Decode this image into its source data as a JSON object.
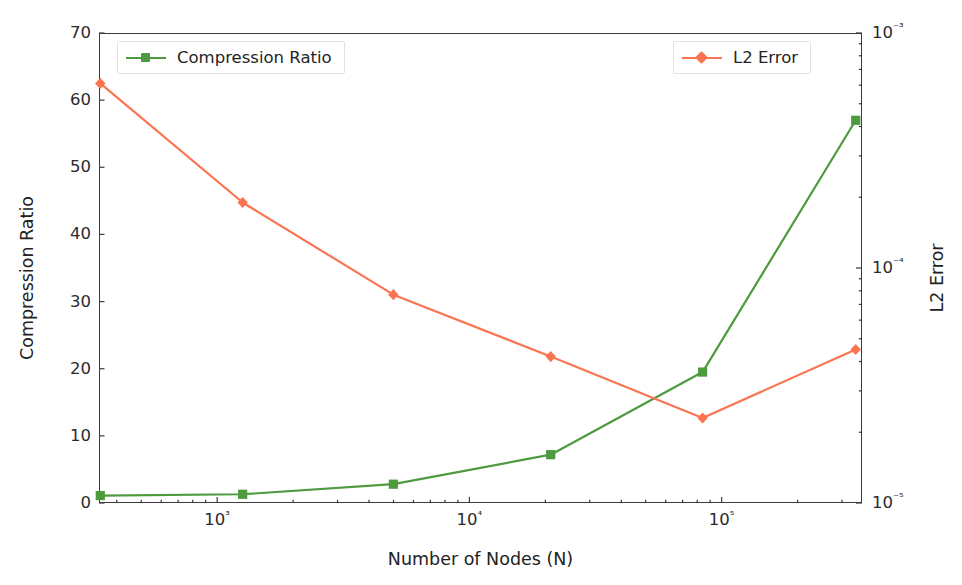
{
  "chart_data": {
    "type": "line",
    "title": "",
    "xlabel": "Number of Nodes (N)",
    "xscale": "log",
    "xlim": [
      340,
      360000
    ],
    "xticks": [
      1000,
      10000,
      100000
    ],
    "xticklabels": [
      "10³",
      "10⁴",
      "10⁵"
    ],
    "grid": false,
    "legend_position": "top-left and top-right",
    "axes": [
      {
        "side": "left",
        "ylabel": "Compression Ratio",
        "yscale": "linear",
        "ylim": [
          0,
          70
        ],
        "yticks": [
          0,
          10,
          20,
          30,
          40,
          50,
          60,
          70
        ],
        "yticklabels": [
          "0",
          "10",
          "20",
          "30",
          "40",
          "50",
          "60",
          "70"
        ]
      },
      {
        "side": "right",
        "ylabel": "L2 Error",
        "yscale": "log",
        "ylim": [
          1e-05,
          0.001
        ],
        "yticks": [
          1e-05,
          0.0001,
          0.001
        ],
        "yticklabels": [
          "10⁻⁵",
          "10⁻⁴",
          "10⁻³"
        ]
      }
    ],
    "x": [
      344,
      1262,
      4994,
      21000,
      84000,
      340000
    ],
    "series": [
      {
        "name": "Compression Ratio",
        "axis": "left",
        "color": "#4d9a3f",
        "marker": "square",
        "values": [
          1.1,
          1.3,
          2.8,
          7.2,
          19.5,
          57.0
        ]
      },
      {
        "name": "L2 Error",
        "axis": "right",
        "color": "#fa7451",
        "marker": "diamond",
        "values": [
          0.00061,
          0.00019,
          7.7e-05,
          4.2e-05,
          2.3e-05,
          4.5e-05
        ]
      }
    ]
  },
  "legend": {
    "left": {
      "label": "Compression Ratio"
    },
    "right": {
      "label": "L2 Error"
    }
  },
  "axis_titles": {
    "left": "Compression Ratio",
    "right": "L2 Error",
    "bottom": "Number of Nodes (N)"
  },
  "colors": {
    "compression_ratio": "#4d9a3f",
    "l2_error": "#fa7451",
    "axis": "#3a3a3a",
    "text": "#262626",
    "background": "#ffffff"
  }
}
